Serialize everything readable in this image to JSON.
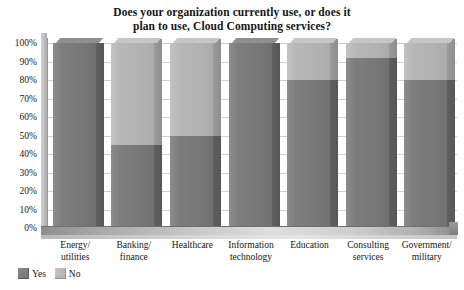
{
  "chart_data": {
    "type": "bar",
    "title": "Does your organization currently use, or does it plan to use, Cloud Computing services?",
    "title_lines": [
      "Does your organization currently use, or does it",
      "plan to use, Cloud Computing services?"
    ],
    "stacked": true,
    "orientation": "vertical",
    "xlabel": "",
    "ylabel": "",
    "ylim": [
      0,
      100
    ],
    "grid": true,
    "legend_position": "bottom-left",
    "categories": [
      "Energy/ utilities",
      "Banking/ finance",
      "Healthcare",
      "Information technology",
      "Education",
      "Consulting services",
      "Government/ military"
    ],
    "category_lines": [
      [
        "Energy/",
        "utilities"
      ],
      [
        "Banking/",
        "finance"
      ],
      [
        "Healthcare",
        ""
      ],
      [
        "Information",
        "technology"
      ],
      [
        "Education",
        ""
      ],
      [
        "Consulting",
        "services"
      ],
      [
        "Government/",
        "military"
      ]
    ],
    "series": [
      {
        "name": "Yes",
        "color": "#7a7a7a",
        "values": [
          100,
          45,
          50,
          100,
          80,
          92,
          80
        ]
      },
      {
        "name": "No",
        "color": "#b4b4b4",
        "values": [
          0,
          55,
          50,
          0,
          20,
          8,
          20
        ]
      }
    ],
    "y_ticks": [
      "100%",
      "90%",
      "80%",
      "70%",
      "60%",
      "50%",
      "40%",
      "30%",
      "20%",
      "10%",
      "0%"
    ],
    "y_tick_values": [
      100,
      90,
      80,
      70,
      60,
      50,
      40,
      30,
      20,
      10,
      0
    ]
  },
  "legend": {
    "items": [
      {
        "label": "Yes",
        "swatch": "dark-gray-swatch"
      },
      {
        "label": "No",
        "swatch": "light-gray-swatch"
      }
    ]
  }
}
